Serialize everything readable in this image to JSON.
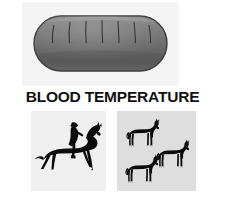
{
  "figure": {
    "caption": "BLOOD TEMPERATURE",
    "background_color": "#ffffff",
    "width": 225,
    "height": 199
  },
  "panels": [
    {
      "id": "top-panel",
      "name": "loaf-illustration-panel",
      "background_color": "#f4f4f4",
      "icon": "bread-loaf-icon",
      "description": "Dark gray rounded loaf of bread with vertical score marks",
      "shape_fill": "#6b6b6b",
      "score_marks": 7
    },
    {
      "id": "bottom-left-panel",
      "name": "dressage-rider-panel",
      "background_color": "#efefef",
      "icon": "horse-and-rider-icon",
      "description": "Black silhouette of a rider mounted on a horse at an extended trot",
      "silhouette_color": "#0b0b0b",
      "figure_count": 1
    },
    {
      "id": "bottom-right-panel",
      "name": "three-horses-panel",
      "background_color": "#dedede",
      "icon": "horse-icon",
      "description": "Three black horse silhouettes standing",
      "silhouette_color": "#0b0b0b",
      "figure_count": 3
    }
  ],
  "caption_style": {
    "text_color": "#111111",
    "weight": "bold",
    "transform": "uppercase"
  }
}
